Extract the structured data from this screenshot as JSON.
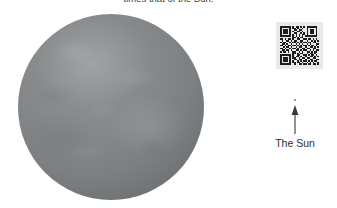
{
  "caption": {
    "text": "times that of the Sun.",
    "clipped": true
  },
  "figure": {
    "star": {
      "name": "large-grey-star",
      "fill_color": "#83868a",
      "highlight_color": "#8f9294",
      "shadow_color": "#64676a"
    },
    "sun_marker": {
      "label": "The Sun",
      "dot_color": "#7a7a7a",
      "arrow_color": "#3a3a3a"
    }
  },
  "qr_code": {
    "name": "qr-code",
    "background_color": "#e9e9e9",
    "module_color": "#1e1e1e",
    "size_modules": 25,
    "matrix": [
      "1111111010110101011111110",
      "1000001011010010010000010",
      "1011101001101100010111010",
      "1011101010011010010111010",
      "1011101001100101010111010",
      "1000001010101011010000010",
      "1111111010101010111111110",
      "0000000011010110000000000",
      "1101011010011001101101010",
      "0100110101100110010010101",
      "1011001011010101101101100",
      "0110100100101010010100011",
      "1101011011010101101011010",
      "0010110100101100100110101",
      "1101001011010011011001100",
      "0110110100110101100101011",
      "1011010011001010011010110",
      "0000000011010110010110100",
      "1111111010011001101011010",
      "1000001010110100100110101",
      "1011101011001011011001100",
      "1011101001101100100110011",
      "1011101010010101101010110",
      "1000001011011010010101001",
      "1111111001001101101101101"
    ]
  }
}
